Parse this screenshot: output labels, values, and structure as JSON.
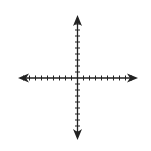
{
  "figure": {
    "type": "coordinate-plane",
    "width": 151,
    "height": 151,
    "background": "#ffffff",
    "axis_color": "#222222",
    "origin": {
      "x": 77.5,
      "y": 78
    },
    "tick_spacing": 6,
    "tick_half_length": 2.5,
    "x_axis": {
      "left_end": 18,
      "right_end": 138,
      "ticks_left": 9,
      "ticks_right": 9,
      "arrows": [
        "left",
        "right"
      ]
    },
    "y_axis": {
      "top_end": 15,
      "bottom_end": 140,
      "ticks_up": 9,
      "ticks_down": 9,
      "arrows": [
        "up",
        "down"
      ]
    },
    "labels": []
  }
}
